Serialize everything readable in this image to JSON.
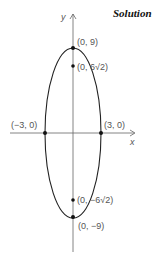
{
  "title": "Solution",
  "axes": {
    "x_label": "x",
    "y_label": "y"
  },
  "ellipse": {
    "a": 3,
    "b": 9
  },
  "points": [
    {
      "label": "(0, 9)",
      "x": 0,
      "y": 9
    },
    {
      "label": "(0, 6√2)",
      "x": 0,
      "y": 8.49
    },
    {
      "label": "(−3, 0)",
      "x": -3,
      "y": 0
    },
    {
      "label": "(3, 0)",
      "x": 3,
      "y": 0
    },
    {
      "label": "(0, −6√2)",
      "x": 0,
      "y": -8.49
    },
    {
      "label": "(0, −9)",
      "x": 0,
      "y": -9
    }
  ]
}
